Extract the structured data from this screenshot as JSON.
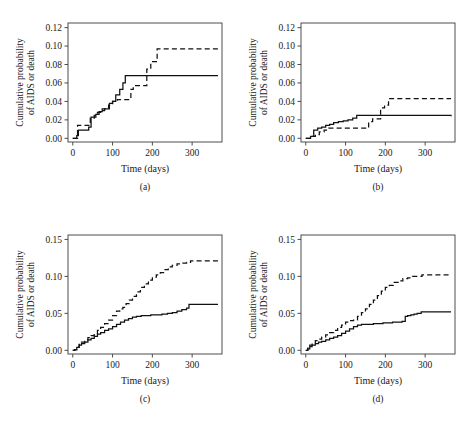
{
  "figure": {
    "type": "multi-panel-step-chart",
    "panel_count": 4,
    "background": "#ffffff",
    "line_color": "#111111"
  },
  "chart_data": [
    {
      "type": "line",
      "panel": "(a)",
      "title": "",
      "xlabel": "Time (days)",
      "ylabel": "Cumulative probability of AIDS or death",
      "ylabel_line1": "Cumulative probability",
      "ylabel_line2": "of AIDS or death",
      "xlim": [
        -12,
        375
      ],
      "ylim": [
        -0.004,
        0.125
      ],
      "xticks": [
        0,
        100,
        200,
        300
      ],
      "xtick_labels": [
        "0",
        "100",
        "200",
        "300"
      ],
      "yticks": [
        0.0,
        0.02,
        0.04,
        0.06,
        0.08,
        0.1,
        0.12
      ],
      "ytick_labels": [
        "0.00",
        "0.02",
        "0.04",
        "0.06",
        "0.08",
        "0.10",
        "0.12"
      ],
      "grid": false,
      "legend": "none",
      "series": [
        {
          "name": "solid",
          "style": "solid",
          "x": [
            0,
            5,
            10,
            14,
            22,
            30,
            40,
            46,
            52,
            58,
            66,
            74,
            82,
            92,
            100,
            108,
            118,
            126,
            132,
            150,
            160,
            200,
            250,
            300,
            365
          ],
          "y": [
            0.0,
            0.0,
            0.003,
            0.009,
            0.009,
            0.009,
            0.012,
            0.023,
            0.023,
            0.026,
            0.029,
            0.032,
            0.032,
            0.038,
            0.04,
            0.047,
            0.053,
            0.06,
            0.068,
            0.068,
            0.068,
            0.068,
            0.068,
            0.068,
            0.068
          ]
        },
        {
          "name": "dashed",
          "style": "dashed",
          "x": [
            0,
            6,
            12,
            18,
            26,
            34,
            44,
            54,
            62,
            70,
            80,
            90,
            100,
            112,
            124,
            136,
            146,
            152,
            162,
            178,
            186,
            196,
            206,
            212,
            260,
            310,
            365
          ],
          "y": [
            0.0,
            0.0,
            0.014,
            0.014,
            0.014,
            0.014,
            0.022,
            0.025,
            0.028,
            0.03,
            0.032,
            0.036,
            0.04,
            0.042,
            0.042,
            0.042,
            0.053,
            0.057,
            0.057,
            0.057,
            0.075,
            0.083,
            0.083,
            0.097,
            0.097,
            0.097,
            0.097
          ]
        }
      ]
    },
    {
      "type": "line",
      "panel": "(b)",
      "title": "",
      "xlabel": "Time (days)",
      "ylabel": "Cumulative probability of AIDS or death",
      "ylabel_line1": "Cumulative probability",
      "ylabel_line2": "of AIDS or death",
      "xlim": [
        -12,
        375
      ],
      "ylim": [
        -0.004,
        0.125
      ],
      "xticks": [
        0,
        100,
        200,
        300
      ],
      "xtick_labels": [
        "0",
        "100",
        "200",
        "300"
      ],
      "yticks": [
        0.0,
        0.02,
        0.04,
        0.06,
        0.08,
        0.1,
        0.12
      ],
      "ytick_labels": [
        "0.00",
        "0.02",
        "0.04",
        "0.06",
        "0.08",
        "0.10",
        "0.12"
      ],
      "grid": false,
      "legend": "none",
      "series": [
        {
          "name": "solid",
          "style": "solid",
          "x": [
            0,
            6,
            12,
            20,
            30,
            40,
            50,
            60,
            70,
            82,
            94,
            106,
            118,
            128,
            138,
            150,
            160,
            185,
            200,
            250,
            300,
            365
          ],
          "y": [
            0.0,
            0.0,
            0.002,
            0.009,
            0.011,
            0.012,
            0.014,
            0.015,
            0.017,
            0.018,
            0.019,
            0.02,
            0.022,
            0.025,
            0.025,
            0.025,
            0.025,
            0.025,
            0.025,
            0.025,
            0.025,
            0.024
          ]
        },
        {
          "name": "dashed",
          "style": "dashed",
          "x": [
            0,
            8,
            16,
            24,
            34,
            46,
            58,
            70,
            84,
            98,
            112,
            126,
            140,
            150,
            158,
            168,
            180,
            188,
            198,
            208,
            216,
            260,
            310,
            365
          ],
          "y": [
            0.0,
            0.0,
            0.002,
            0.004,
            0.007,
            0.009,
            0.011,
            0.011,
            0.011,
            0.011,
            0.011,
            0.011,
            0.011,
            0.011,
            0.018,
            0.021,
            0.021,
            0.033,
            0.036,
            0.043,
            0.043,
            0.043,
            0.043,
            0.043
          ]
        }
      ]
    },
    {
      "type": "line",
      "panel": "(c)",
      "title": "",
      "xlabel": "Time (days)",
      "ylabel": "Cumulative probability of AIDS or death",
      "ylabel_line1": "Cumulative probability",
      "ylabel_line2": "of AIDS or death",
      "xlim": [
        -12,
        375
      ],
      "ylim": [
        -0.005,
        0.156
      ],
      "xticks": [
        0,
        100,
        200,
        300
      ],
      "xtick_labels": [
        "0",
        "100",
        "200",
        "300"
      ],
      "yticks": [
        0.0,
        0.05,
        0.1,
        0.15
      ],
      "ytick_labels": [
        "0.00",
        "0.05",
        "0.10",
        "0.15"
      ],
      "grid": false,
      "legend": "none",
      "series": [
        {
          "name": "solid",
          "style": "solid",
          "x": [
            0,
            5,
            10,
            16,
            22,
            30,
            38,
            46,
            54,
            62,
            70,
            80,
            90,
            100,
            110,
            120,
            130,
            140,
            150,
            160,
            172,
            184,
            196,
            210,
            224,
            238,
            250,
            262,
            274,
            286,
            292,
            300,
            320,
            345,
            365
          ],
          "y": [
            0.0,
            0.001,
            0.004,
            0.007,
            0.009,
            0.011,
            0.014,
            0.016,
            0.019,
            0.022,
            0.024,
            0.027,
            0.029,
            0.032,
            0.035,
            0.038,
            0.041,
            0.043,
            0.045,
            0.046,
            0.047,
            0.047,
            0.048,
            0.048,
            0.049,
            0.05,
            0.051,
            0.053,
            0.055,
            0.057,
            0.062,
            0.062,
            0.062,
            0.062,
            0.062
          ]
        },
        {
          "name": "dashed",
          "style": "dashed",
          "x": [
            0,
            5,
            10,
            16,
            22,
            30,
            38,
            46,
            54,
            62,
            70,
            80,
            90,
            100,
            110,
            118,
            126,
            134,
            142,
            150,
            160,
            170,
            180,
            190,
            200,
            210,
            220,
            230,
            240,
            250,
            262,
            274,
            286,
            296,
            310,
            330,
            350,
            365
          ],
          "y": [
            0.0,
            0.001,
            0.004,
            0.008,
            0.011,
            0.014,
            0.017,
            0.02,
            0.023,
            0.027,
            0.031,
            0.036,
            0.041,
            0.047,
            0.053,
            0.056,
            0.058,
            0.063,
            0.068,
            0.073,
            0.079,
            0.085,
            0.09,
            0.095,
            0.099,
            0.102,
            0.105,
            0.109,
            0.113,
            0.115,
            0.117,
            0.118,
            0.119,
            0.121,
            0.121,
            0.121,
            0.121,
            0.121
          ]
        }
      ]
    },
    {
      "type": "line",
      "panel": "(d)",
      "title": "",
      "xlabel": "Time (days)",
      "ylabel": "Cumulative probability of AIDS or death",
      "ylabel_line1": "Cumulative probability",
      "ylabel_line2": "of AIDS or death",
      "xlim": [
        -12,
        375
      ],
      "ylim": [
        -0.005,
        0.156
      ],
      "xticks": [
        0,
        100,
        200,
        300
      ],
      "xtick_labels": [
        "0",
        "100",
        "200",
        "300"
      ],
      "yticks": [
        0.0,
        0.05,
        0.1,
        0.15
      ],
      "ytick_labels": [
        "0.00",
        "0.05",
        "0.10",
        "0.15"
      ],
      "grid": false,
      "legend": "none",
      "series": [
        {
          "name": "solid",
          "style": "solid",
          "x": [
            0,
            5,
            10,
            16,
            24,
            32,
            40,
            50,
            60,
            70,
            80,
            90,
            100,
            110,
            120,
            130,
            140,
            148,
            158,
            170,
            182,
            194,
            206,
            218,
            230,
            242,
            250,
            256,
            264,
            272,
            280,
            290,
            300,
            330,
            365
          ],
          "y": [
            0.0,
            0.002,
            0.005,
            0.007,
            0.009,
            0.011,
            0.012,
            0.014,
            0.016,
            0.018,
            0.02,
            0.023,
            0.026,
            0.029,
            0.032,
            0.034,
            0.035,
            0.035,
            0.035,
            0.036,
            0.036,
            0.037,
            0.037,
            0.038,
            0.038,
            0.039,
            0.046,
            0.047,
            0.048,
            0.049,
            0.05,
            0.052,
            0.052,
            0.052,
            0.052
          ]
        },
        {
          "name": "dashed",
          "style": "dashed",
          "x": [
            0,
            5,
            10,
            16,
            24,
            32,
            40,
            50,
            60,
            70,
            80,
            90,
            100,
            110,
            120,
            130,
            140,
            150,
            160,
            170,
            180,
            190,
            200,
            210,
            220,
            232,
            244,
            256,
            268,
            280,
            292,
            300,
            330,
            365
          ],
          "y": [
            0.0,
            0.003,
            0.007,
            0.01,
            0.013,
            0.015,
            0.018,
            0.021,
            0.024,
            0.027,
            0.031,
            0.034,
            0.038,
            0.04,
            0.041,
            0.046,
            0.051,
            0.056,
            0.062,
            0.068,
            0.074,
            0.08,
            0.085,
            0.088,
            0.092,
            0.094,
            0.097,
            0.098,
            0.1,
            0.1,
            0.102,
            0.102,
            0.102,
            0.102
          ]
        }
      ]
    }
  ]
}
